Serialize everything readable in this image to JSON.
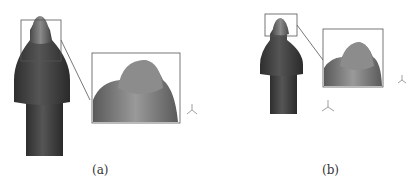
{
  "figure": {
    "panels": [
      {
        "id": "a",
        "caption": "(a)",
        "subject": "cutting pick with magnified tip inset"
      },
      {
        "id": "b",
        "caption": "(b)",
        "subject": "cutting pick with magnified tip inset"
      }
    ]
  }
}
